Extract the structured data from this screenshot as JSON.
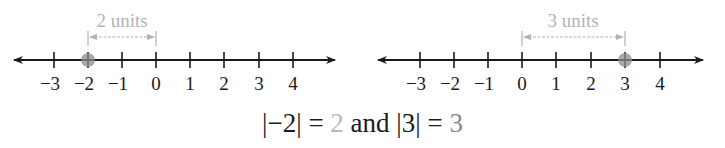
{
  "number_lines": [
    {
      "id": "left",
      "tick_labels": [
        "−3",
        "−2",
        "−1",
        "0",
        "1",
        "2",
        "3",
        "4"
      ],
      "tick_values": [
        -3,
        -2,
        -1,
        0,
        1,
        2,
        3,
        4
      ],
      "highlighted_point": -2,
      "distance_from": -2,
      "distance_to": 0,
      "distance_label": "2 units"
    },
    {
      "id": "right",
      "tick_labels": [
        "−3",
        "−2",
        "−1",
        "0",
        "1",
        "2",
        "3",
        "4"
      ],
      "tick_values": [
        -3,
        -2,
        -1,
        0,
        1,
        2,
        3,
        4
      ],
      "highlighted_point": 3,
      "distance_from": 0,
      "distance_to": 3,
      "distance_label": "3 units"
    }
  ],
  "equation": {
    "part1": "|−2| = ",
    "value1": "2",
    "middle": " and |3| = ",
    "value2": "3"
  },
  "colors": {
    "axis": "#1a1a1a",
    "annotation": "#b3b3b3",
    "point": "#8c8c8c"
  }
}
